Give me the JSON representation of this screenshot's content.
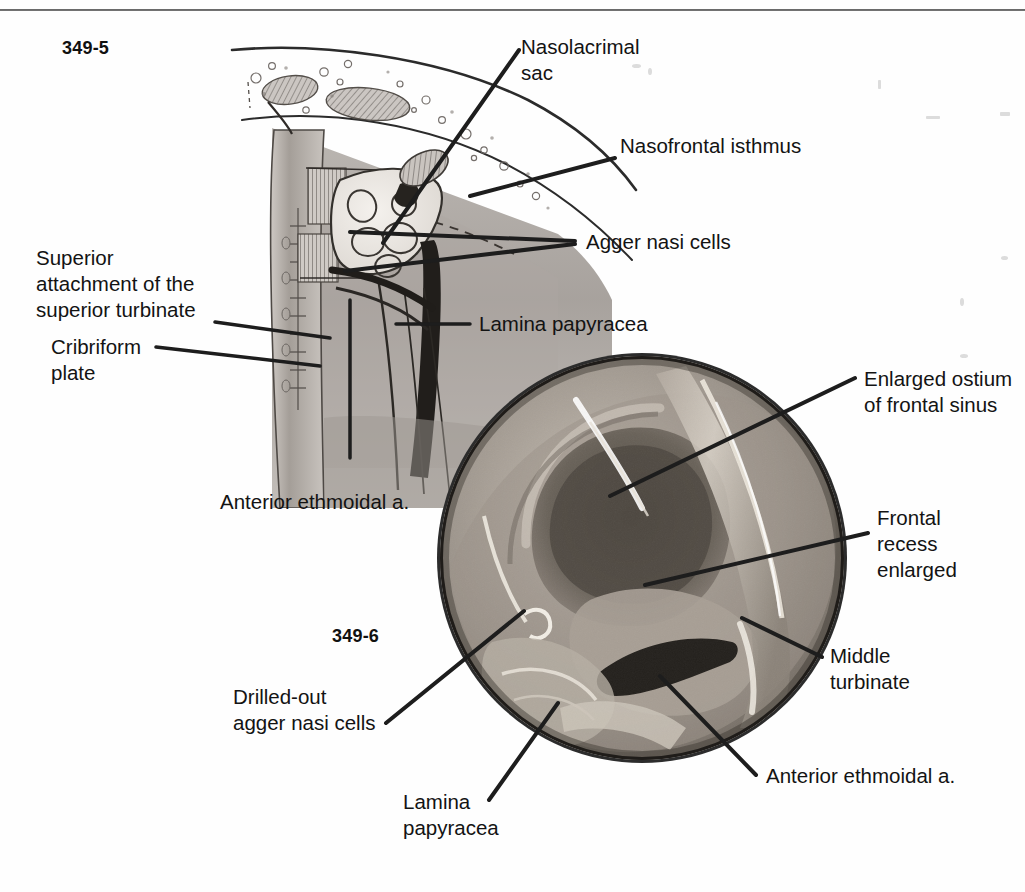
{
  "page": {
    "background_color": "#ffffff",
    "ink_color": "#1a1a1a",
    "rule_color": "#555555"
  },
  "figures": [
    {
      "id": "fig-349-5",
      "number": "349-5",
      "type": "sagittal-line-drawing",
      "description": "Parasagittal line drawing of the lateral nasal wall showing the frontal recess region, agger nasi cells, nasolacrimal sac and anterior ethmoidal artery."
    },
    {
      "id": "fig-349-6",
      "number": "349-6",
      "type": "endoscopic-photograph",
      "description": "Circular endoscopic photograph of the enlarged frontal sinus ostium after drill-out of the agger nasi cells."
    }
  ],
  "labels": {
    "nasolacrimal_sac": "Nasolacrimal\nsac",
    "nasofrontal_isthmus": "Nasofrontal isthmus",
    "agger_nasi_cells": "Agger nasi cells",
    "lamina_papyracea_top": "Lamina papyracea",
    "superior_attachment": "Superior\nattachment of the\nsuperior turbinate",
    "cribriform_plate": "Cribriform\nplate",
    "anterior_ethmoidal_a_top": "Anterior ethmoidal a.",
    "enlarged_ostium": "Enlarged ostium\nof frontal sinus",
    "frontal_recess_enlarged": "Frontal\nrecess\nenlarged",
    "middle_turbinate": "Middle\nturbinate",
    "anterior_ethmoidal_a_bottom": "Anterior ethmoidal a.",
    "drilled_out_agger_nasi": "Drilled-out\nagger nasi cells",
    "lamina_papyracea_bottom": "Lamina\npapyracea"
  },
  "colors": {
    "leader_line": "#1d1d1d",
    "tissue_mid": "#a9a4a0",
    "tissue_dark": "#6f6a66",
    "tissue_light": "#d9d5d1",
    "endoscope_dark": "#3a3632",
    "endoscope_mid": "#8d857c",
    "endoscope_light": "#cfc7bd"
  }
}
